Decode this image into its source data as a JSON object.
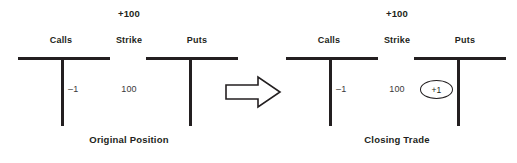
{
  "diagram": {
    "title_semantics": "options-t-account-closing-trade",
    "background_color": "#ffffff",
    "ink_color": "#231f20",
    "entry_color": "#3a3a3a",
    "transition_icon": "right-arrow-icon"
  },
  "panels": [
    {
      "id": "original-position",
      "credit_label": "+100",
      "headers": {
        "calls": "Calls",
        "strike": "Strike",
        "puts": "Puts"
      },
      "calls_entry": "–1",
      "strike_value": "100",
      "puts_entry": "",
      "puts_entry_circled": false,
      "caption": "Original Position"
    },
    {
      "id": "closing-trade",
      "credit_label": "+100",
      "headers": {
        "calls": "Calls",
        "strike": "Strike",
        "puts": "Puts"
      },
      "calls_entry": "–1",
      "strike_value": "100",
      "puts_entry": "+1",
      "puts_entry_circled": true,
      "caption": "Closing Trade"
    }
  ]
}
